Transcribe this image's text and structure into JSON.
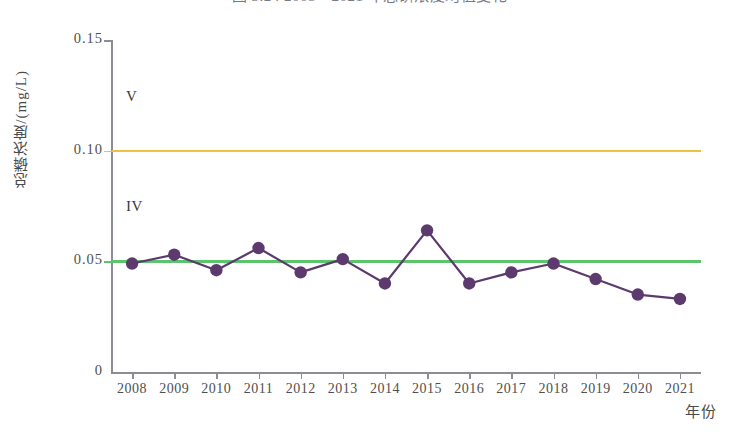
{
  "chart_data": {
    "type": "line",
    "title": "图 3.24  2008—2021 年总磷浓度均值变化",
    "xlabel": "年份",
    "ylabel": "总磷浓度/(mg/L)",
    "categories": [
      "2008",
      "2009",
      "2010",
      "2011",
      "2012",
      "2013",
      "2014",
      "2015",
      "2016",
      "2017",
      "2018",
      "2019",
      "2020",
      "2021"
    ],
    "series": [
      {
        "name": "总磷浓度均值",
        "values": [
          0.049,
          0.053,
          0.046,
          0.056,
          0.045,
          0.051,
          0.04,
          0.064,
          0.04,
          0.045,
          0.049,
          0.042,
          0.035,
          0.033
        ],
        "color": "#5c3a6e",
        "marker": "circle"
      }
    ],
    "reference_lines": [
      {
        "name": "V 类标准",
        "label": "V",
        "value": 0.1,
        "color": "#f0c040"
      },
      {
        "name": "IV 类标准",
        "label": "IV",
        "value": 0.05,
        "color": "#5cc46a"
      }
    ],
    "ylim": [
      0,
      0.15
    ],
    "yticks": [
      "0",
      "0.05",
      "0.10",
      "0.15"
    ],
    "ytick_values": [
      0,
      0.05,
      0.1,
      0.15
    ],
    "grid": false,
    "legend": "none"
  },
  "colors": {
    "series_line": "#5c3a6e",
    "marker_fill": "#5c3a6e",
    "v_line": "#f0c040",
    "iv_line": "#5cc46a",
    "axis": "#8c8c94",
    "text": "#4f4f4f",
    "background": "#ffffff"
  }
}
